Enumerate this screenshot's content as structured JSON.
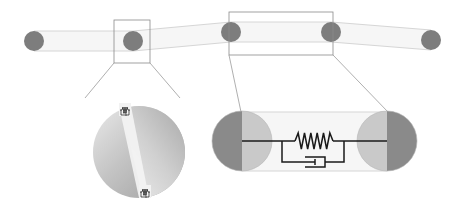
{
  "diagram": {
    "width": 461,
    "height": 208,
    "colors": {
      "background": "#ffffff",
      "node": "#7d7d7d",
      "bond_fill": "#f6f6f6",
      "bond_edge": "#d6d6d6",
      "inset_box": "#8a8a8a",
      "connector": "#9a9a9a",
      "sphere_dark": "#8a8a8a",
      "sphere_light": "#c9c9c9",
      "circuit": "#1a1a1a"
    },
    "chain": {
      "node_radius": 10,
      "bond_half_width": 10,
      "nodes": [
        {
          "id": "n1",
          "x": 34,
          "y": 41
        },
        {
          "id": "n2",
          "x": 133,
          "y": 41
        },
        {
          "id": "n3",
          "x": 231,
          "y": 32
        },
        {
          "id": "n4",
          "x": 331,
          "y": 32
        },
        {
          "id": "n5",
          "x": 431,
          "y": 40
        }
      ]
    },
    "insets": [
      {
        "id": "left-inset",
        "box": {
          "x": 114,
          "y": 20,
          "w": 36,
          "h": 43
        },
        "connectors": [
          {
            "x1": 114,
            "y1": 63,
            "x2": 85,
            "y2": 98
          },
          {
            "x1": 150,
            "y1": 63,
            "x2": 180,
            "y2": 98
          }
        ],
        "zoom_view": "contact-disc"
      },
      {
        "id": "right-inset",
        "box": {
          "x": 229,
          "y": 12,
          "w": 104,
          "h": 43
        },
        "connectors": [
          {
            "x1": 229,
            "y1": 55,
            "x2": 241,
            "y2": 112
          },
          {
            "x1": 333,
            "y1": 55,
            "x2": 388,
            "y2": 112
          }
        ],
        "zoom_view": "kelvin-voigt-bond"
      }
    ],
    "contact_disc": {
      "cx": 139,
      "cy": 152,
      "r": 46,
      "top_element": {
        "x": 120,
        "y": 104,
        "label": "spring-dashpot-glyph"
      },
      "bottom_element": {
        "x": 140,
        "y": 186,
        "label": "spring-dashpot-glyph"
      }
    },
    "kelvin_voigt_bond": {
      "left_sphere": {
        "cx": 242,
        "cy": 141,
        "r": 30
      },
      "right_sphere": {
        "cx": 387,
        "cy": 141,
        "r": 30
      },
      "cylinder": {
        "x": 242,
        "y": 112,
        "w": 145,
        "h": 59
      },
      "line_y": 141,
      "spring": {
        "x_start": 295,
        "x_end": 333,
        "zigs": 6,
        "amplitude": 8
      },
      "dashpot": {
        "x_left": 282,
        "x_right": 344,
        "lower_y": 162,
        "piston_x": 315,
        "cup_x": 325
      }
    }
  }
}
